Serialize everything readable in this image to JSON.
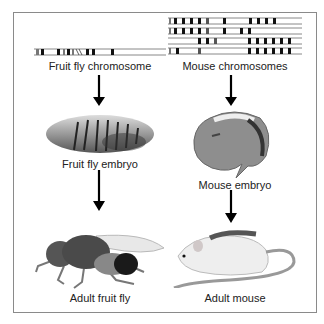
{
  "left_column": {
    "chromosome_label": "Fruit fly chromosome",
    "embryo_label": "Fruit fly embryo",
    "adult_label": "Adult fruit fly"
  },
  "right_column": {
    "chromosome_label": "Mouse chromosomes",
    "embryo_label": "Mouse embryo",
    "adult_label": "Adult mouse"
  },
  "colors": {
    "frame": "#8a8a8a",
    "band_dark": "#111111",
    "band_gray": "#777777",
    "arrow": "#000000"
  }
}
